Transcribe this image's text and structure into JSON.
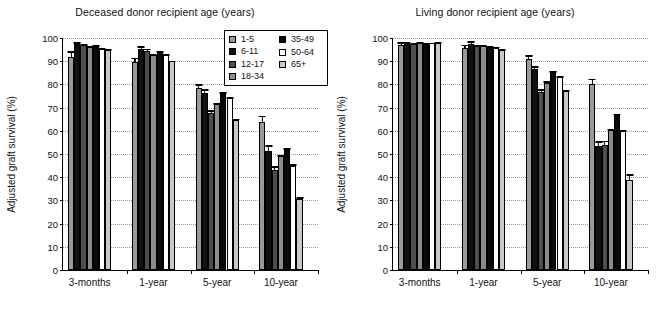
{
  "chart_data": [
    {
      "type": "bar",
      "title": "Deceased donor recipient age (years)",
      "xlabel": "",
      "ylabel": "Adjusted graft survival (%)",
      "ylim": [
        0,
        100
      ],
      "yticks": [
        0,
        10,
        20,
        30,
        40,
        50,
        60,
        70,
        80,
        90,
        100
      ],
      "grid": true,
      "legend_position": "top-right",
      "categories": [
        "3-months",
        "1-year",
        "5-year",
        "10-year"
      ],
      "series": [
        {
          "name": "1-5",
          "color": "#9a9a9a",
          "values": [
            92.0,
            89.8,
            78.3,
            64.0
          ],
          "errors": [
            2.2,
            1.7,
            1.8,
            2.6
          ]
        },
        {
          "name": "6-11",
          "color": "#101010",
          "values": [
            97.6,
            95.3,
            76.5,
            51.5
          ],
          "errors": [
            0.6,
            1.3,
            1.5,
            2.4
          ]
        },
        {
          "name": "12-17",
          "color": "#4e4e4e",
          "values": [
            96.8,
            94.6,
            67.6,
            43.0
          ],
          "errors": [
            0.5,
            0.8,
            1.4,
            1.7
          ]
        },
        {
          "name": "18-34",
          "color": "#8c8c8c",
          "values": [
            96.3,
            92.8,
            71.4,
            49.0
          ],
          "errors": [
            0.3,
            0.4,
            0.5,
            0.6
          ]
        },
        {
          "name": "35-49",
          "color": "#0a0a0a",
          "values": [
            96.5,
            94.0,
            76.2,
            52.0
          ],
          "errors": [
            0.3,
            0.3,
            0.4,
            0.5
          ]
        },
        {
          "name": "50-64",
          "color": "#ffffff",
          "values": [
            95.3,
            92.8,
            74.0,
            45.0
          ],
          "errors": [
            0.3,
            0.3,
            0.4,
            0.5
          ]
        },
        {
          "name": "65+",
          "color": "#c8c8c8",
          "values": [
            94.8,
            89.9,
            64.6,
            30.5
          ],
          "errors": [
            0.4,
            0.4,
            0.6,
            0.8
          ]
        }
      ]
    },
    {
      "type": "bar",
      "title": "Living donor recipient age (years)",
      "xlabel": "",
      "ylabel": "Adjusted graft survival (%)",
      "ylim": [
        0,
        100
      ],
      "yticks": [
        0,
        10,
        20,
        30,
        40,
        50,
        60,
        70,
        80,
        90,
        100
      ],
      "grid": true,
      "legend_position": "none",
      "categories": [
        "3-months",
        "1-year",
        "5-year",
        "10-year"
      ],
      "series": [
        {
          "name": "1-5",
          "color": "#9a9a9a",
          "values": [
            97.2,
            95.8,
            91.0,
            80.2
          ],
          "errors": [
            1.1,
            1.3,
            1.5,
            2.2
          ]
        },
        {
          "name": "6-11",
          "color": "#101010",
          "values": [
            97.7,
            97.5,
            86.5,
            53.5
          ],
          "errors": [
            0.8,
            1.1,
            1.3,
            2.0
          ]
        },
        {
          "name": "12-17",
          "color": "#4e4e4e",
          "values": [
            97.3,
            96.4,
            76.8,
            53.8
          ],
          "errors": [
            0.5,
            0.7,
            1.2,
            1.9
          ]
        },
        {
          "name": "18-34",
          "color": "#8c8c8c",
          "values": [
            97.9,
            96.5,
            80.8,
            60.3
          ],
          "errors": [
            0.3,
            0.4,
            0.5,
            0.7
          ]
        },
        {
          "name": "35-49",
          "color": "#0a0a0a",
          "values": [
            97.7,
            96.2,
            85.3,
            66.8
          ],
          "errors": [
            0.2,
            0.3,
            0.4,
            0.5
          ]
        },
        {
          "name": "50-64",
          "color": "#ffffff",
          "values": [
            97.8,
            95.9,
            83.2,
            59.8
          ],
          "errors": [
            0.2,
            0.3,
            0.4,
            0.5
          ]
        },
        {
          "name": "65+",
          "color": "#c8c8c8",
          "values": [
            97.9,
            94.8,
            77.0,
            39.0
          ],
          "errors": [
            0.3,
            0.4,
            0.6,
            2.2
          ]
        }
      ]
    }
  ],
  "legend": {
    "column1": [
      {
        "label": "1-5",
        "color": "#9a9a9a"
      },
      {
        "label": "6-11",
        "color": "#101010"
      },
      {
        "label": "12-17",
        "color": "#4e4e4e"
      },
      {
        "label": "18-34",
        "color": "#8c8c8c"
      }
    ],
    "column2": [
      {
        "label": "35-49",
        "color": "#0a0a0a"
      },
      {
        "label": "50-64",
        "color": "#ffffff"
      },
      {
        "label": "65+",
        "color": "#c8c8c8"
      }
    ]
  }
}
